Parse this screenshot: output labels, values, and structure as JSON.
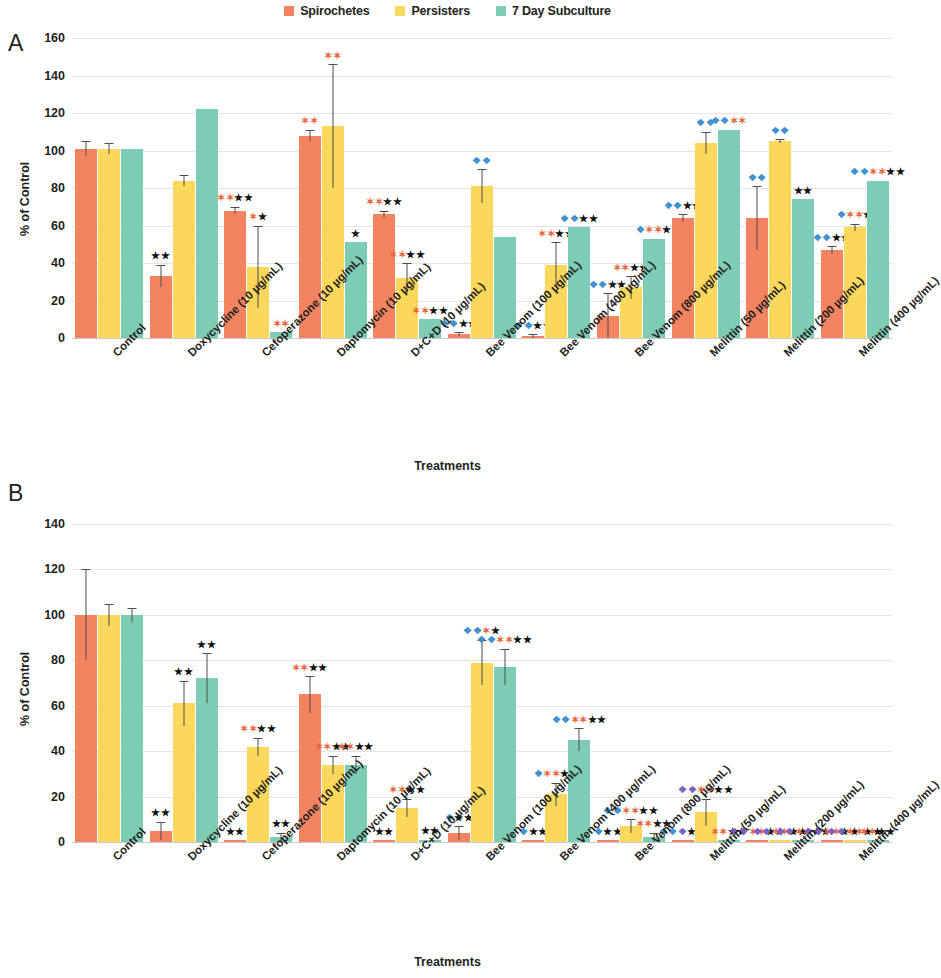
{
  "legend": {
    "items": [
      {
        "label": "Spirochetes",
        "color": "#F4845F"
      },
      {
        "label": "Persisters",
        "color": "#FBD75B"
      },
      {
        "label": "7 Day Subculture",
        "color": "#7DCCB6"
      }
    ]
  },
  "panels": {
    "a": {
      "letter": "A",
      "ylabel": "% of Control",
      "xtitle": "Treatments"
    },
    "b": {
      "letter": "B",
      "ylabel": "% of Control",
      "xtitle": "Treatments"
    }
  },
  "chart_data": [
    {
      "type": "bar",
      "panel": "A",
      "title": "",
      "xlabel": "Treatments",
      "ylabel": "% of Control",
      "ylim": [
        0,
        160
      ],
      "yticks": [
        0,
        20,
        40,
        60,
        80,
        100,
        120,
        140,
        160
      ],
      "grid": true,
      "legend_position": "top-center",
      "categories": [
        "Control",
        "Doxycycline (10 µg/mL)",
        "Cefoperazone (10 µg/mL)",
        "Daptomycin (10 µg/mL)",
        "D+C+D (10 µg/mL)",
        "Bee Venom (100 µg/mL)",
        "Bee Venom (400 µg/mL)",
        "Bee Venom (800 µg/mL)",
        "Melittin (50 µg/mL)",
        "Melittin (200 µg/mL)",
        "Melittin (400 µg/mL)"
      ],
      "series": [
        {
          "name": "Spirochetes",
          "color": "#F4845F",
          "values": [
            101,
            33,
            68,
            108,
            66,
            2,
            1,
            12,
            64,
            64,
            47
          ],
          "errors": [
            4,
            6,
            2,
            3,
            2,
            1,
            1,
            12,
            2,
            17,
            2
          ]
        },
        {
          "name": "Persisters",
          "color": "#FBD75B",
          "values": [
            101,
            84,
            38,
            113,
            32,
            81,
            39,
            27,
            104,
            105,
            59
          ],
          "errors": [
            3,
            3,
            22,
            33,
            8,
            9,
            12,
            6,
            6,
            1,
            2
          ]
        },
        {
          "name": "7 Day Subculture",
          "color": "#7DCCB6",
          "values": [
            101,
            122,
            3,
            51,
            10,
            54,
            59,
            53,
            111,
            74,
            84
          ]
        }
      ],
      "annotations": [
        {
          "group": 1,
          "series": "Spirochetes",
          "marks": [
            [
              "black",
              "★★"
            ]
          ]
        },
        {
          "group": 2,
          "series": "Spirochetes",
          "marks": [
            [
              "orange",
              "✶✶"
            ],
            [
              "black",
              "★★"
            ]
          ]
        },
        {
          "group": 2,
          "series": "Persisters",
          "marks": [
            [
              "orange",
              "✶"
            ],
            [
              "black",
              "★"
            ]
          ]
        },
        {
          "group": 2,
          "series": "7 Day Subculture",
          "marks": [
            [
              "orange",
              "✶✶"
            ]
          ]
        },
        {
          "group": 3,
          "series": "Spirochetes",
          "marks": [
            [
              "orange",
              "✶✶"
            ]
          ]
        },
        {
          "group": 3,
          "series": "Persisters",
          "marks": [
            [
              "orange",
              "✶✶"
            ]
          ]
        },
        {
          "group": 3,
          "series": "7 Day Subculture",
          "marks": [
            [
              "black",
              "★"
            ]
          ]
        },
        {
          "group": 4,
          "series": "Spirochetes",
          "marks": [
            [
              "orange",
              "✶✶"
            ],
            [
              "black",
              "★★"
            ]
          ]
        },
        {
          "group": 4,
          "series": "Persisters",
          "marks": [
            [
              "orange",
              "✶✶"
            ],
            [
              "black",
              "★★"
            ]
          ]
        },
        {
          "group": 4,
          "series": "7 Day Subculture",
          "marks": [
            [
              "orange",
              "✶✶"
            ],
            [
              "black",
              "★★"
            ]
          ]
        },
        {
          "group": 5,
          "series": "Spirochetes",
          "marks": [
            [
              "blue",
              "❖❖"
            ],
            [
              "black",
              "★★"
            ]
          ]
        },
        {
          "group": 5,
          "series": "Persisters",
          "marks": [
            [
              "blue",
              "❖❖"
            ]
          ]
        },
        {
          "group": 6,
          "series": "Spirochetes",
          "marks": [
            [
              "blue",
              "❖❖"
            ],
            [
              "black",
              "★★"
            ]
          ]
        },
        {
          "group": 6,
          "series": "Persisters",
          "marks": [
            [
              "orange",
              "✶✶"
            ],
            [
              "black",
              "★★"
            ]
          ]
        },
        {
          "group": 6,
          "series": "7 Day Subculture",
          "marks": [
            [
              "blue",
              "❖❖"
            ],
            [
              "black",
              "★★"
            ]
          ]
        },
        {
          "group": 7,
          "series": "Spirochetes",
          "marks": [
            [
              "blue",
              "❖❖"
            ],
            [
              "black",
              "★★"
            ]
          ]
        },
        {
          "group": 7,
          "series": "Persisters",
          "marks": [
            [
              "orange",
              "✶✶"
            ],
            [
              "black",
              "★★"
            ]
          ]
        },
        {
          "group": 7,
          "series": "7 Day Subculture",
          "marks": [
            [
              "blue",
              "❖"
            ],
            [
              "orange",
              "✶✶"
            ],
            [
              "black",
              "★"
            ]
          ]
        },
        {
          "group": 8,
          "series": "Spirochetes",
          "marks": [
            [
              "blue",
              "❖❖"
            ],
            [
              "black",
              "★★"
            ]
          ]
        },
        {
          "group": 8,
          "series": "Persisters",
          "marks": [
            [
              "blue",
              "❖❖"
            ]
          ]
        },
        {
          "group": 8,
          "series": "7 Day Subculture",
          "marks": [
            [
              "blue",
              "❖❖"
            ],
            [
              "orange",
              "✶✶"
            ]
          ]
        },
        {
          "group": 9,
          "series": "Spirochetes",
          "marks": [
            [
              "blue",
              "❖❖"
            ]
          ]
        },
        {
          "group": 9,
          "series": "Persisters",
          "marks": [
            [
              "blue",
              "❖❖"
            ]
          ]
        },
        {
          "group": 9,
          "series": "7 Day Subculture",
          "marks": [
            [
              "black",
              "★★"
            ]
          ]
        },
        {
          "group": 10,
          "series": "Spirochetes",
          "marks": [
            [
              "blue",
              "❖❖"
            ],
            [
              "black",
              "★★"
            ]
          ]
        },
        {
          "group": 10,
          "series": "Persisters",
          "marks": [
            [
              "blue",
              "❖"
            ],
            [
              "orange",
              "✶✶"
            ],
            [
              "black",
              "★"
            ]
          ]
        },
        {
          "group": 10,
          "series": "7 Day Subculture",
          "marks": [
            [
              "blue",
              "❖❖"
            ],
            [
              "orange",
              "✶✶"
            ],
            [
              "black",
              "★★"
            ]
          ]
        }
      ]
    },
    {
      "type": "bar",
      "panel": "B",
      "title": "",
      "xlabel": "Treatments",
      "ylabel": "% of Control",
      "ylim": [
        0,
        140
      ],
      "yticks": [
        0,
        20,
        40,
        60,
        80,
        100,
        120,
        140
      ],
      "grid": true,
      "legend_position": "top-center",
      "categories": [
        "Control",
        "Doxycycline (10 µg/mL)",
        "Cefoperazone (10 µg/mL)",
        "Daptomycin (10 µg/mL)",
        "D+C+D (10 µg/mL)",
        "Bee Venom (100 µg/mL)",
        "Bee Venom (400 µg/mL)",
        "Bee Venom (800 µg/mL)",
        "Melittin (50 µg/mL)",
        "Melittin (200 µg/mL)",
        "Melittin (400 µg/mL)"
      ],
      "series": [
        {
          "name": "Spirochetes",
          "color": "#F4845F",
          "values": [
            100,
            5,
            0.5,
            65,
            0.5,
            4,
            0.5,
            0.5,
            0.5,
            0.5,
            0.5
          ],
          "errors": [
            20,
            4,
            0,
            8,
            0,
            3,
            0,
            0,
            0,
            0,
            0
          ]
        },
        {
          "name": "Persisters",
          "color": "#FBD75B",
          "values": [
            100,
            61,
            42,
            34,
            15,
            79,
            21,
            7,
            13,
            0.5,
            0.5
          ],
          "errors": [
            5,
            10,
            4,
            4,
            4,
            10,
            5,
            3,
            6,
            0,
            0
          ]
        },
        {
          "name": "7 Day Subculture",
          "color": "#7DCCB6",
          "values": [
            100,
            72,
            2,
            34,
            1,
            77,
            45,
            2,
            0.5,
            0.5,
            0.5
          ],
          "errors": [
            3,
            11,
            2,
            4,
            0,
            8,
            5,
            2,
            0,
            0,
            0
          ]
        }
      ],
      "annotations": [
        {
          "group": 1,
          "series": "Spirochetes",
          "marks": [
            [
              "black",
              "★★"
            ]
          ]
        },
        {
          "group": 1,
          "series": "Persisters",
          "marks": [
            [
              "black",
              "★★"
            ]
          ]
        },
        {
          "group": 1,
          "series": "7 Day Subculture",
          "marks": [
            [
              "black",
              "★★"
            ]
          ]
        },
        {
          "group": 2,
          "series": "Spirochetes",
          "marks": [
            [
              "black",
              "★★"
            ]
          ]
        },
        {
          "group": 2,
          "series": "Persisters",
          "marks": [
            [
              "orange",
              "✶✶"
            ],
            [
              "black",
              "★★"
            ]
          ]
        },
        {
          "group": 2,
          "series": "7 Day Subculture",
          "marks": [
            [
              "black",
              "★★"
            ]
          ]
        },
        {
          "group": 3,
          "series": "Spirochetes",
          "marks": [
            [
              "orange",
              "✶✶"
            ],
            [
              "black",
              "★★"
            ]
          ]
        },
        {
          "group": 3,
          "series": "Persisters",
          "marks": [
            [
              "orange",
              "✶✶"
            ],
            [
              "black",
              "★★"
            ]
          ]
        },
        {
          "group": 3,
          "series": "7 Day Subculture",
          "marks": [
            [
              "orange",
              "✶✶"
            ],
            [
              "black",
              "★★"
            ]
          ]
        },
        {
          "group": 4,
          "series": "Spirochetes",
          "marks": [
            [
              "black",
              "★★"
            ]
          ]
        },
        {
          "group": 4,
          "series": "Persisters",
          "marks": [
            [
              "orange",
              "✶✶"
            ],
            [
              "black",
              "★★"
            ]
          ]
        },
        {
          "group": 4,
          "series": "7 Day Subculture",
          "marks": [
            [
              "black",
              "★★"
            ]
          ]
        },
        {
          "group": 5,
          "series": "Spirochetes",
          "marks": [
            [
              "blue",
              "❖"
            ],
            [
              "black",
              "★★"
            ]
          ]
        },
        {
          "group": 5,
          "series": "Persisters",
          "marks": [
            [
              "blue",
              "❖❖"
            ],
            [
              "orange",
              "✶"
            ],
            [
              "black",
              "★"
            ]
          ]
        },
        {
          "group": 5,
          "series": "7 Day Subculture",
          "marks": [
            [
              "blue",
              "❖❖"
            ],
            [
              "orange",
              "✶✶"
            ],
            [
              "black",
              "★★"
            ]
          ]
        },
        {
          "group": 6,
          "series": "Spirochetes",
          "marks": [
            [
              "blue",
              "❖"
            ],
            [
              "black",
              "★★"
            ]
          ]
        },
        {
          "group": 6,
          "series": "Persisters",
          "marks": [
            [
              "blue",
              "❖"
            ],
            [
              "orange",
              "✶✶"
            ],
            [
              "black",
              "★★"
            ]
          ]
        },
        {
          "group": 6,
          "series": "7 Day Subculture",
          "marks": [
            [
              "blue",
              "❖❖"
            ],
            [
              "orange",
              "✶✶"
            ],
            [
              "black",
              "★★"
            ]
          ]
        },
        {
          "group": 7,
          "series": "Spirochetes",
          "marks": [
            [
              "blue",
              "❖"
            ],
            [
              "black",
              "★★"
            ]
          ]
        },
        {
          "group": 7,
          "series": "Persisters",
          "marks": [
            [
              "blue",
              "❖❖"
            ],
            [
              "orange",
              "✶✶"
            ],
            [
              "black",
              "★★"
            ]
          ]
        },
        {
          "group": 7,
          "series": "7 Day Subculture",
          "marks": [
            [
              "orange",
              "✶✶"
            ],
            [
              "black",
              "★★"
            ]
          ]
        },
        {
          "group": 8,
          "series": "Spirochetes",
          "marks": [
            [
              "blue",
              "❖❖"
            ],
            [
              "purple",
              "❖"
            ],
            [
              "black",
              "★★"
            ]
          ]
        },
        {
          "group": 8,
          "series": "Persisters",
          "marks": [
            [
              "purple",
              "❖❖"
            ],
            [
              "orange",
              "✶✶"
            ],
            [
              "black",
              "★★"
            ]
          ]
        },
        {
          "group": 8,
          "series": "7 Day Subculture",
          "marks": [
            [
              "orange",
              "✶✶"
            ],
            [
              "black",
              "★★"
            ]
          ]
        },
        {
          "group": 9,
          "series": "Spirochetes",
          "marks": [
            [
              "purple",
              "❖❖"
            ],
            [
              "orange",
              "✶✶"
            ],
            [
              "black",
              "★★"
            ]
          ]
        },
        {
          "group": 9,
          "series": "Persisters",
          "marks": [
            [
              "purple",
              "❖❖"
            ],
            [
              "orange",
              "✶✶"
            ],
            [
              "black",
              "★★"
            ]
          ]
        },
        {
          "group": 9,
          "series": "7 Day Subculture",
          "marks": [
            [
              "purple",
              "❖❖"
            ],
            [
              "orange",
              "✶✶"
            ],
            [
              "black",
              "★★"
            ]
          ]
        },
        {
          "group": 10,
          "series": "Spirochetes",
          "marks": [
            [
              "purple",
              "❖❖"
            ],
            [
              "orange",
              "✶✶"
            ],
            [
              "black",
              "★★"
            ]
          ]
        },
        {
          "group": 10,
          "series": "Persisters",
          "marks": [
            [
              "purple",
              "❖❖"
            ],
            [
              "orange",
              "✶✶"
            ],
            [
              "black",
              "★★"
            ]
          ]
        },
        {
          "group": 10,
          "series": "7 Day Subculture",
          "marks": [
            [
              "orange",
              "✶✶"
            ],
            [
              "black",
              "★★"
            ]
          ]
        }
      ]
    }
  ]
}
